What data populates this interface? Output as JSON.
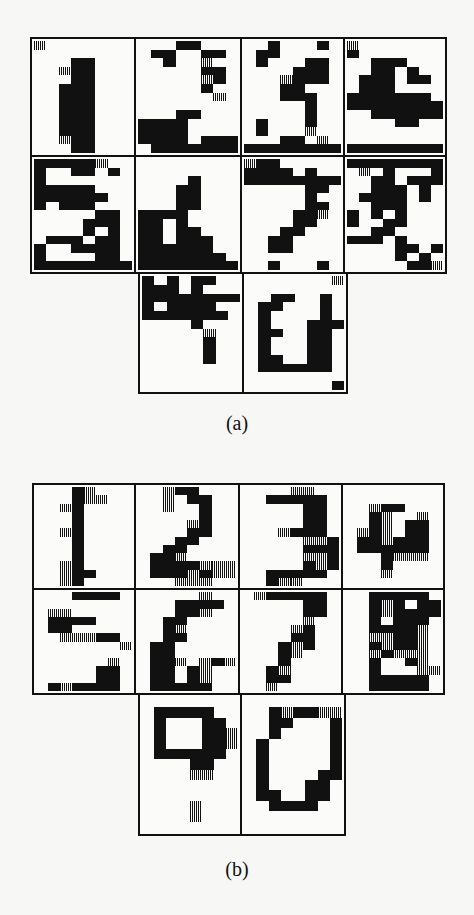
{
  "figure": {
    "panels": [
      {
        "id": "a",
        "caption": "(a)",
        "description": "Noisy bitmap digit patterns 1-9 and 0",
        "cells": [
          {
            "label": "1",
            "rows": [
              "20000000",
              "00000000",
              "00033000",
              "00233000",
              "00033000",
              "00333000",
              "00333000",
              "00333000",
              "00333000",
              "00333000",
              "00333000",
              "00233000",
              "00033000"
            ]
          },
          {
            "label": "2",
            "rows": [
              "00033000",
              "03300330",
              "00300200",
              "00000330",
              "00000230",
              "00000300",
              "00000020",
              "00000000",
              "00033000",
              "33330000",
              "33330000",
              "33330333",
              "03333333"
            ]
          },
          {
            "label": "3",
            "rows": [
              "00300030",
              "03300000",
              "03000330",
              "00003330",
              "00023330",
              "00033000",
              "00033300",
              "00000300",
              "00000300",
              "03000300",
              "03000200",
              "00033020",
              "33333333"
            ]
          },
          {
            "label": "4",
            "rows": [
              "20000000",
              "30000000",
              "00333000",
              "00330300",
              "03330330",
              "03330000",
              "33333330",
              "33333333",
              "00333333",
              "00003300",
              "00000000",
              "00000000",
              "33333333"
            ]
          },
          {
            "label": "5",
            "rows": [
              "33333200",
              "30033030",
              "30000000",
              "33333000",
              "33333300",
              "30333000",
              "00000330",
              "00003330",
              "00003030",
              "03330330",
              "30033330",
              "30000330",
              "33333333"
            ]
          },
          {
            "label": "6",
            "rows": [
              "00000000",
              "00000000",
              "00003000",
              "00033000",
              "00033000",
              "00033000",
              "33330000",
              "33030000",
              "33033000",
              "33033300",
              "33333300",
              "33333330",
              "33333333"
            ]
          },
          {
            "label": "7",
            "rows": [
              "23300000",
              "33330300",
              "33333333",
              "00000330",
              "00000300",
              "00000330",
              "00003320",
              "00003300",
              "00033000",
              "00330000",
              "00330000",
              "00000000",
              "00300030"
            ]
          },
          {
            "label": "8",
            "rows": [
              "33333333",
              "02030003",
              "00330333",
              "00333030",
              "03333030",
              "00333000",
              "30303000",
              "30033000",
              "00330000",
              "33303000",
              "00003303",
              "00003030",
              "00000332"
            ]
          },
          {
            "label": "9",
            "rows": [
              "30303300",
              "33303000",
              "33333333",
              "30333300",
              "33333330",
              "00003000",
              "00000200",
              "00000300",
              "00000300",
              "00000300",
              "00000000",
              "00000000",
              "00000000"
            ]
          },
          {
            "label": "0",
            "rows": [
              "00000002",
              "00000000",
              "00330030",
              "03300030",
              "03000030",
              "03000333",
              "03300330",
              "03000330",
              "03000330",
              "03300330",
              "03333330",
              "00000000",
              "00000003"
            ]
          }
        ]
      },
      {
        "id": "b",
        "caption": "(b)",
        "description": "Reconstructed bitmap digit patterns 1-9 and 0",
        "cells": [
          {
            "label": "1",
            "rows": [
              "00032000",
              "00032200",
              "00230000",
              "00030000",
              "00030000",
              "00230000",
              "00030000",
              "00030000",
              "00030000",
              "00230000",
              "00233000",
              "00230000"
            ]
          },
          {
            "label": "2",
            "rows": [
              "00233000",
              "00203300",
              "00200300",
              "00000300",
              "00002300",
              "00003300",
              "00033000",
              "00330000",
              "03320000",
              "03333222",
              "03332322",
              "00022200"
            ]
          },
          {
            "label": "3",
            "rows": [
              "00002200",
              "00333330",
              "00000330",
              "00000330",
              "00000330",
              "00023330",
              "00000223",
              "00000333",
              "00000223",
              "00000323",
              "00333330",
              "00322000"
            ]
          },
          {
            "label": "4",
            "rows": [
              "00000000",
              "00000000",
              "00233000",
              "00320020",
              "00320330",
              "02320330",
              "03323330",
              "03333330",
              "00032220",
              "00030000",
              "00020000",
              "00000000"
            ]
          },
          {
            "label": "5",
            "rows": [
              "00033330",
              "00000000",
              "02200000",
              "03333000",
              "03300000",
              "00222330",
              "00000002",
              "00000000",
              "00000020",
              "00000330",
              "00000330",
              "03233330"
            ]
          },
          {
            "label": "6",
            "rows": [
              "00000200",
              "00033330",
              "00033200",
              "00330000",
              "00320000",
              "00330000",
              "03300000",
              "03300000",
              "03320232",
              "03303200",
              "03303200",
              "03333300"
            ]
          },
          {
            "label": "7",
            "rows": [
              "02333330",
              "00000330",
              "00000330",
              "00000200",
              "00002300",
              "00003300",
              "00032300",
              "00032000",
              "00030000",
              "00320000",
              "00330000",
              "00200000"
            ]
          },
          {
            "label": "8",
            "rows": [
              "00333330",
              "00323033",
              "00323333",
              "00303330",
              "00333320",
              "00223320",
              "00323320",
              "00232220",
              "00300320",
              "00300022",
              "00333330",
              "00333330"
            ]
          }
        ]
      }
    ],
    "extra_cells_b": [
      {
        "label": "8-lower",
        "rows": [
          "00000000",
          "03333300",
          "03000330",
          "03000332",
          "03000332",
          "03333330",
          "00003300",
          "00002200",
          "00000000",
          "00000000",
          "00002000",
          "00002000",
          "00000000"
        ]
      },
      {
        "label": "0",
        "rows": [
          "00000000",
          "00323322",
          "00330003",
          "00300003",
          "03000003",
          "03000003",
          "03000003",
          "03000033",
          "03000330",
          "03300330",
          "00333300",
          "00000000",
          "00000000"
        ]
      }
    ]
  }
}
